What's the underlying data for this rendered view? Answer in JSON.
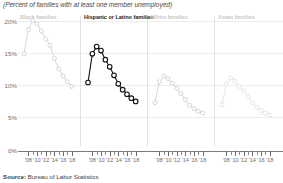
{
  "subtitle": "(Percent of families with at least one member unemployed)",
  "source_prefix": "Source:",
  "source_text": " Bureau of Labor Statistics",
  "axis": {
    "y_ticks": [
      "0%",
      "5%",
      "10%",
      "15%",
      "20%"
    ],
    "x_ticks": [
      "'08",
      "'10",
      "'12",
      "'14",
      "'16",
      "'18"
    ]
  },
  "panels": [
    {
      "title": "Black families",
      "highlight": false
    },
    {
      "title": "Hispanic or Latino families",
      "highlight": true
    },
    {
      "title": "White families",
      "highlight": false
    },
    {
      "title": "Asian families",
      "highlight": false
    }
  ],
  "chart_data": {
    "type": "line",
    "title": "",
    "subtitle": "(Percent of families with at least one member unemployed)",
    "xlabel": "",
    "ylabel": "",
    "ylim": [
      0,
      21
    ],
    "xlim": [
      2007,
      2019
    ],
    "ytick_values": [
      0,
      5,
      10,
      15,
      20
    ],
    "ytick_labels": [
      "0%",
      "5%",
      "10%",
      "15%",
      "20%"
    ],
    "xtick_values": [
      2008,
      2010,
      2012,
      2014,
      2016,
      2018
    ],
    "xtick_labels": [
      "'08",
      "'10",
      "'12",
      "'14",
      "'16",
      "'18"
    ],
    "grid": true,
    "legend": "panel titles",
    "markers": "open circles",
    "x": [
      2007,
      2008,
      2009,
      2010,
      2011,
      2012,
      2013,
      2014,
      2015,
      2016,
      2017,
      2018
    ],
    "series": [
      {
        "name": "Black families",
        "color": "#cfcfcf",
        "values": [
          14.9,
          18.6,
          20.0,
          19.5,
          18.4,
          17.2,
          16.2,
          14.2,
          12.6,
          11.5,
          10.6,
          9.9
        ]
      },
      {
        "name": "Hispanic or Latino families",
        "color": "#111111",
        "values": [
          10.5,
          14.9,
          16.0,
          15.4,
          14.0,
          12.9,
          11.6,
          10.3,
          9.4,
          8.7,
          8.1,
          7.6
        ]
      },
      {
        "name": "White families",
        "color": "#cfcfcf",
        "values": [
          7.4,
          10.6,
          11.5,
          11.1,
          10.4,
          9.6,
          8.8,
          7.9,
          7.0,
          6.5,
          6.1,
          5.8
        ]
      },
      {
        "name": "Asian families",
        "color": "#e0e0e0",
        "values": [
          7.1,
          10.3,
          11.2,
          10.7,
          9.9,
          9.2,
          8.3,
          7.4,
          6.7,
          6.2,
          5.8,
          5.5
        ]
      }
    ]
  }
}
